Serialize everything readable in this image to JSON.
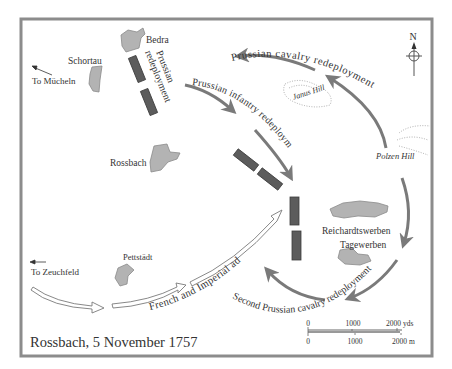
{
  "map": {
    "title": "Rossbach, 5 November 1757",
    "colors": {
      "frame": "#8c8c8c",
      "town_fill": "#b3b3b3",
      "town_stroke": "#8a8a8a",
      "unit_fill": "#5c5c5c",
      "arrow_grey": "#7a7a7a",
      "text": "#333333"
    },
    "compass": {
      "label": "N"
    },
    "towns": [
      {
        "name": "Bedra"
      },
      {
        "name": "Schortau"
      },
      {
        "name": "Rossbach"
      },
      {
        "name": "Reichardtswerben"
      },
      {
        "name": "Tagewerben"
      },
      {
        "name": "Pettstädt"
      }
    ],
    "hills": [
      {
        "name": "Janus Hill"
      },
      {
        "name": "Polzen Hill"
      }
    ],
    "directions": [
      {
        "label": "To Mücheln"
      },
      {
        "label": "To Zeuchfeld"
      }
    ],
    "movements": {
      "prussian_cavalry": "Prussian cavalry redeployment",
      "prussian_infantry": "Prussian infantry redeployment",
      "prussian_redeployment_line1": "Prussian",
      "prussian_redeployment_line2": "redeployment",
      "french_imperial": "French and Imperial advance",
      "second_cavalry": "Second Prussian cavalry redeployment"
    },
    "scale": {
      "yds": {
        "ticks": [
          "0",
          "1000",
          "2000 yds"
        ]
      },
      "m": {
        "ticks": [
          "0",
          "1000",
          "2000 m"
        ]
      }
    }
  }
}
